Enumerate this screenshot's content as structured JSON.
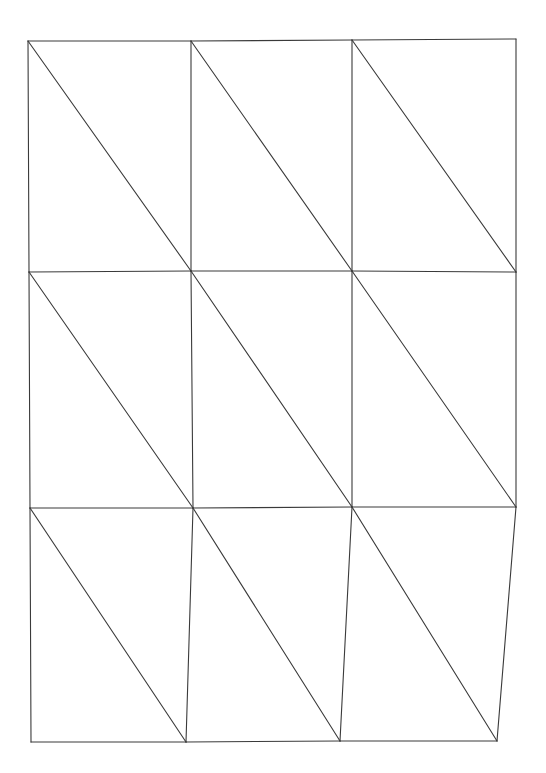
{
  "page": {
    "width": 546,
    "height": 773,
    "background": "#ffffff",
    "stroke_color": "#3a3a3a"
  },
  "diagram": {
    "rows": 3,
    "cols": 3,
    "grid_points": [
      [
        [
          28,
          41
        ],
        [
          191,
          41
        ],
        [
          352,
          40
        ],
        [
          516,
          39
        ]
      ],
      [
        [
          29,
          272
        ],
        [
          191,
          271
        ],
        [
          352,
          271
        ],
        [
          516,
          272
        ]
      ],
      [
        [
          30,
          508
        ],
        [
          193,
          508
        ],
        [
          352,
          507
        ],
        [
          516,
          507
        ]
      ],
      [
        [
          31,
          742
        ],
        [
          186,
          742
        ],
        [
          340,
          741
        ],
        [
          497,
          741
        ]
      ]
    ]
  }
}
